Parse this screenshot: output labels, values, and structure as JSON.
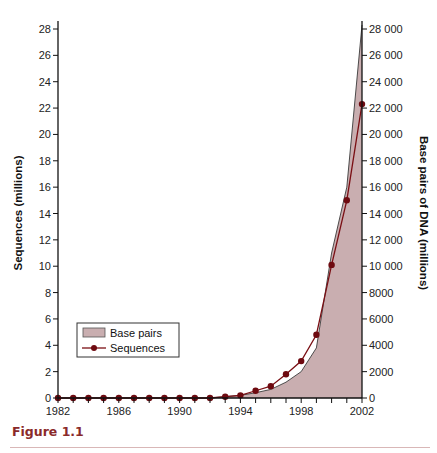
{
  "caption": "Figure 1.1",
  "colors": {
    "area_fill": "#c9aeb0",
    "area_edge": "#3a3a3a",
    "sequence_line": "#7a0f14",
    "marker": "#6e0a10",
    "axis": "#111111",
    "caption": "#8a2a2a"
  },
  "chart_data": {
    "type": "line",
    "title": "",
    "xlabel": "",
    "ylabel": "Sequences (millions)",
    "y2label": "Base pairs of DNA (millions)",
    "x": [
      1982,
      1983,
      1984,
      1985,
      1986,
      1987,
      1988,
      1989,
      1990,
      1991,
      1992,
      1993,
      1994,
      1995,
      1996,
      1997,
      1998,
      1999,
      2000,
      2001,
      2002
    ],
    "xlim": [
      1982,
      2002
    ],
    "ylim": [
      0,
      28
    ],
    "y2lim": [
      0,
      28000
    ],
    "x_ticks": [
      1982,
      1983,
      1984,
      1985,
      1986,
      1987,
      1988,
      1989,
      1990,
      1991,
      1992,
      1993,
      1994,
      1995,
      1996,
      1997,
      1998,
      1999,
      2000,
      2001,
      2002
    ],
    "x_tick_labels": [
      "1982",
      "1986",
      "1990",
      "1994",
      "1998",
      "2002"
    ],
    "y_ticks": [
      "0",
      "2",
      "4",
      "6",
      "8",
      "10",
      "12",
      "14",
      "16",
      "18",
      "20",
      "22",
      "24",
      "26",
      "28"
    ],
    "y2_ticks": [
      "0",
      "2000",
      "4000",
      "6000",
      "8000",
      "10 000",
      "12 000",
      "14 000",
      "16 000",
      "18 000",
      "20 000",
      "22 000",
      "24 000",
      "26 000",
      "28 000"
    ],
    "grid": false,
    "legend_position": "lower-left",
    "series": [
      {
        "name": "Base pairs",
        "type": "area",
        "axis": "right",
        "values": [
          0,
          0,
          0,
          0,
          0,
          0,
          0,
          0,
          0,
          0,
          0,
          100,
          200,
          400,
          650,
          1200,
          2000,
          3800,
          11000,
          16000,
          28500
        ]
      },
      {
        "name": "Sequences",
        "type": "line",
        "axis": "left",
        "values": [
          0,
          0,
          0,
          0,
          0,
          0,
          0,
          0,
          0,
          0,
          0,
          0.1,
          0.2,
          0.55,
          0.9,
          1.8,
          2.8,
          4.8,
          10.1,
          15.0,
          22.3
        ]
      }
    ]
  }
}
